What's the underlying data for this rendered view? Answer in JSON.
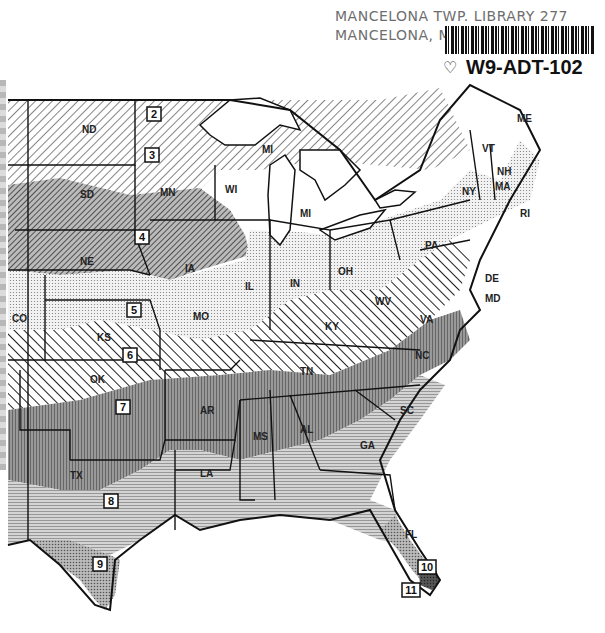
{
  "library_stamp": {
    "line1": "MANCELONA TWP. LIBRARY  277",
    "line2": "MANCELONA, MICH."
  },
  "barcode": {
    "id": "W9-ADT-102",
    "icon": "leaf-outline-icon"
  },
  "map": {
    "title": "Plant hardiness zones — eastern & central United States",
    "zones": [
      {
        "label": "2",
        "x": 154,
        "y": 115
      },
      {
        "label": "3",
        "x": 152,
        "y": 155
      },
      {
        "label": "4",
        "x": 142,
        "y": 237
      },
      {
        "label": "5",
        "x": 134,
        "y": 310
      },
      {
        "label": "6",
        "x": 130,
        "y": 355
      },
      {
        "label": "7",
        "x": 123,
        "y": 407
      },
      {
        "label": "8",
        "x": 111,
        "y": 501
      },
      {
        "label": "9",
        "x": 100,
        "y": 564
      },
      {
        "label": "10",
        "x": 427,
        "y": 567
      },
      {
        "label": "11",
        "x": 411,
        "y": 590
      }
    ],
    "states": [
      {
        "abbr": "ND",
        "x": 82,
        "y": 133
      },
      {
        "abbr": "SD",
        "x": 80,
        "y": 198
      },
      {
        "abbr": "MN",
        "x": 160,
        "y": 196
      },
      {
        "abbr": "WI",
        "x": 225,
        "y": 193
      },
      {
        "abbr": "MI",
        "x": 262,
        "y": 153
      },
      {
        "abbr": "MI",
        "x": 300,
        "y": 217
      },
      {
        "abbr": "NE",
        "x": 80,
        "y": 265
      },
      {
        "abbr": "IA",
        "x": 185,
        "y": 272
      },
      {
        "abbr": "IL",
        "x": 245,
        "y": 290
      },
      {
        "abbr": "IN",
        "x": 290,
        "y": 287
      },
      {
        "abbr": "OH",
        "x": 338,
        "y": 275
      },
      {
        "abbr": "PA",
        "x": 425,
        "y": 249
      },
      {
        "abbr": "NY",
        "x": 462,
        "y": 195
      },
      {
        "abbr": "VT",
        "x": 482,
        "y": 152
      },
      {
        "abbr": "NH",
        "x": 497,
        "y": 175
      },
      {
        "abbr": "ME",
        "x": 517,
        "y": 122
      },
      {
        "abbr": "MA",
        "x": 495,
        "y": 190
      },
      {
        "abbr": "RI",
        "x": 520,
        "y": 217
      },
      {
        "abbr": "DE",
        "x": 485,
        "y": 282
      },
      {
        "abbr": "MD",
        "x": 485,
        "y": 302
      },
      {
        "abbr": "CO",
        "x": 12,
        "y": 322
      },
      {
        "abbr": "KS",
        "x": 97,
        "y": 341
      },
      {
        "abbr": "MO",
        "x": 193,
        "y": 320
      },
      {
        "abbr": "KY",
        "x": 325,
        "y": 330
      },
      {
        "abbr": "WV",
        "x": 375,
        "y": 305
      },
      {
        "abbr": "VA",
        "x": 420,
        "y": 323
      },
      {
        "abbr": "NC",
        "x": 415,
        "y": 359
      },
      {
        "abbr": "TN",
        "x": 300,
        "y": 375
      },
      {
        "abbr": "OK",
        "x": 90,
        "y": 383
      },
      {
        "abbr": "AR",
        "x": 200,
        "y": 414
      },
      {
        "abbr": "SC",
        "x": 400,
        "y": 414
      },
      {
        "abbr": "MS",
        "x": 253,
        "y": 440
      },
      {
        "abbr": "AL",
        "x": 300,
        "y": 433
      },
      {
        "abbr": "GA",
        "x": 360,
        "y": 449
      },
      {
        "abbr": "TX",
        "x": 70,
        "y": 479
      },
      {
        "abbr": "LA",
        "x": 200,
        "y": 477
      },
      {
        "abbr": "FL",
        "x": 405,
        "y": 538
      }
    ]
  }
}
